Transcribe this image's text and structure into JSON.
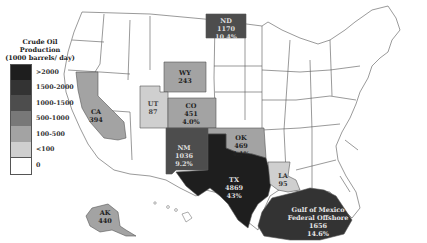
{
  "legend": {
    "title_lines": [
      "Crude Oil",
      "Production",
      "(1000 barrels/ day)"
    ],
    "bins": [
      {
        "label": ">2000",
        "color": "#1e1e1e"
      },
      {
        "label": "1500-2000",
        "color": "#333333"
      },
      {
        "label": "1000-1500",
        "color": "#4d4d4d"
      },
      {
        "label": "500-1000",
        "color": "#787878"
      },
      {
        "label": "100-500",
        "color": "#a3a3a3"
      },
      {
        "label": "<100",
        "color": "#cfcfcf"
      },
      {
        "label": "0",
        "color": "#ffffff"
      }
    ]
  },
  "states": [
    {
      "abbr": "ND",
      "value": "1170",
      "share": "10.4%",
      "bin": "1000-1500"
    },
    {
      "abbr": "WY",
      "value": "243",
      "share": "",
      "bin": "100-500"
    },
    {
      "abbr": "CA",
      "value": "394",
      "share": "",
      "bin": "100-500"
    },
    {
      "abbr": "UT",
      "value": "87",
      "share": "",
      "bin": "<100"
    },
    {
      "abbr": "CO",
      "value": "451",
      "share": "4.0%",
      "bin": "100-500"
    },
    {
      "abbr": "OK",
      "value": "469",
      "share": "4.1%",
      "bin": "100-500"
    },
    {
      "abbr": "NM",
      "value": "1036",
      "share": "9.2%",
      "bin": "1000-1500"
    },
    {
      "abbr": "TX",
      "value": "4869",
      "share": "43%",
      "bin": ">2000"
    },
    {
      "abbr": "LA",
      "value": "95",
      "share": "",
      "bin": "<100"
    },
    {
      "abbr": "AK",
      "value": "440",
      "share": "",
      "bin": "100-500"
    }
  ],
  "offshore": {
    "name_lines": [
      "Gulf of Mexico",
      "Federal Offshore"
    ],
    "value": "1656",
    "share": "14.6%",
    "bin": "1500-2000"
  }
}
